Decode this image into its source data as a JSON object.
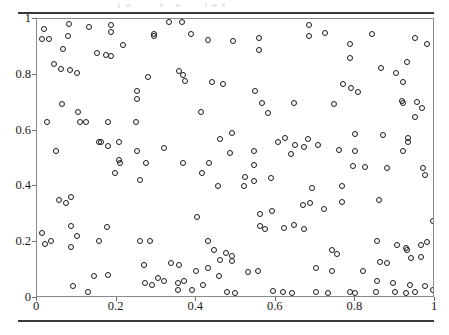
{
  "figure": {
    "background_color": "#ffffff",
    "marker_color": "#1a1a1a",
    "frame_color": "#8a8a8a",
    "rule_color": "#3a3a3a",
    "title": "",
    "top_rule_label": "",
    "bottom_rule_label": ""
  },
  "axes": {
    "x_ticklabels": [
      "0",
      "0.2",
      "0.4",
      "0.6",
      "0.8",
      "1"
    ],
    "y_ticklabels": [
      "0",
      "0.2",
      "0.4",
      "0.6",
      "0.8",
      "1"
    ],
    "x_tickvalues": [
      0,
      0.2,
      0.4,
      0.6,
      0.8,
      1
    ],
    "y_tickvalues": [
      0,
      0.2,
      0.4,
      0.6,
      0.8,
      1
    ]
  },
  "chart_data": {
    "type": "scatter",
    "title": "",
    "xlabel": "",
    "ylabel": "",
    "xlim": [
      0,
      1
    ],
    "ylim": [
      0,
      1
    ],
    "grid": false,
    "legend": null,
    "marker": "open-circle",
    "series": [
      {
        "name": "points",
        "n": 200,
        "x": [
          0.018,
          0.013,
          0.03,
          0.08,
          0.078,
          0.065,
          0.131,
          0.186,
          0.186,
          0.216,
          0.151,
          0.173,
          0.186,
          0.364,
          0.294,
          0.294,
          0.387,
          0.43,
          0.492,
          0.279,
          0.372,
          0.44,
          0.467,
          0.558,
          0.558,
          0.683,
          0.724,
          0.683,
          0.786,
          0.841,
          0.95,
          0.787,
          0.93,
          0.98,
          0.864,
          0.902,
          0.92,
          0.769,
          0.788,
          0.063,
          0.103,
          0.123,
          0.025,
          0.108,
          0.178,
          0.249,
          0.156,
          0.206,
          0.178,
          0.048,
          0.161,
          0.319,
          0.251,
          0.49,
          0.459,
          0.485,
          0.251,
          0.251,
          0.412,
          0.548,
          0.565,
          0.646,
          0.746,
          0.581,
          0.545,
          0.806,
          0.918,
          0.92,
          0.955,
          0.967,
          0.95,
          0.8,
          0.869,
          0.932,
          0.932,
          0.92,
          0.546,
          0.8,
          0.206,
          0.209,
          0.274,
          0.367,
          0.432,
          0.196,
          0.415,
          0.259,
          0.455,
          0.055,
          0.073,
          0.085,
          0.402,
          0.085,
          0.176,
          0.606,
          0.623,
          0.648,
          0.67,
          0.682,
          0.638,
          0.545,
          0.705,
          0.76,
          0.523,
          0.589,
          0.52,
          0.69,
          0.794,
          0.824,
          0.766,
          0.879,
          0.969,
          0.975,
          0.86,
          0.686,
          0.766,
          0.561,
          0.591,
          0.668,
          0.72,
          0.013,
          0.1,
          0.085,
          0.56,
          0.572,
          0.62,
          0.645,
          0.67,
          0.995,
          0.035,
          0.155,
          0.26,
          0.283,
          0.43,
          0.02,
          0.855,
          0.905,
          0.928,
          0.965,
          0.98,
          0.965,
          0.445,
          0.474,
          0.49,
          0.46,
          0.49,
          0.74,
          0.755,
          0.93,
          0.94,
          0.862,
          0.88,
          0.82,
          0.27,
          0.7,
          0.742,
          0.43,
          0.305,
          0.318,
          0.4,
          0.458,
          0.53,
          0.556,
          0.272,
          0.29,
          0.355,
          0.37,
          0.418,
          0.142,
          0.178,
          0.855,
          0.895,
          0.937,
          0.975,
          0.995,
          0.042,
          0.06,
          0.084,
          0.1,
          0.332,
          0.356,
          0.366,
          0.336,
          0.357,
          0.091,
          0.128,
          0.355,
          0.39,
          0.478,
          0.498,
          0.593,
          0.617,
          0.64,
          0.7,
          0.73,
          0.787,
          0.8,
          0.852,
          0.9,
          0.926,
          0.95
        ],
        "y": [
          0.965,
          0.928,
          0.928,
          0.981,
          0.939,
          0.892,
          0.971,
          0.978,
          0.953,
          0.908,
          0.878,
          0.872,
          0.866,
          0.99,
          0.946,
          0.939,
          0.946,
          0.925,
          0.921,
          0.793,
          0.778,
          0.774,
          0.766,
          0.931,
          0.888,
          0.98,
          0.95,
          0.939,
          0.91,
          0.946,
          0.931,
          0.862,
          0.845,
          0.91,
          0.824,
          0.806,
          0.774,
          0.766,
          0.753,
          0.696,
          0.667,
          0.632,
          0.632,
          0.632,
          0.632,
          0.632,
          0.56,
          0.56,
          0.546,
          0.528,
          0.56,
          0.537,
          0.528,
          0.59,
          0.57,
          0.52,
          0.742,
          0.714,
          0.668,
          0.743,
          0.699,
          0.699,
          0.696,
          0.664,
          0.527,
          0.739,
          0.706,
          0.699,
          0.702,
          0.681,
          0.649,
          0.589,
          0.584,
          0.573,
          0.56,
          0.528,
          0.478,
          0.527,
          0.495,
          0.484,
          0.484,
          0.484,
          0.484,
          0.448,
          0.448,
          0.423,
          0.402,
          0.352,
          0.342,
          0.362,
          0.29,
          0.258,
          0.255,
          0.56,
          0.572,
          0.55,
          0.54,
          0.57,
          0.515,
          0.418,
          0.548,
          0.53,
          0.435,
          0.43,
          0.4,
          0.395,
          0.472,
          0.47,
          0.402,
          0.465,
          0.465,
          0.44,
          0.35,
          0.34,
          0.345,
          0.3,
          0.312,
          0.332,
          0.318,
          0.232,
          0.222,
          0.182,
          0.258,
          0.248,
          0.252,
          0.262,
          0.248,
          0.275,
          0.205,
          0.205,
          0.205,
          0.205,
          0.205,
          0.195,
          0.205,
          0.19,
          0.178,
          0.19,
          0.2,
          0.148,
          0.172,
          0.16,
          0.152,
          0.138,
          0.132,
          0.172,
          0.158,
          0.172,
          0.142,
          0.13,
          0.125,
          0.098,
          0.118,
          0.108,
          0.098,
          0.108,
          0.072,
          0.06,
          0.098,
          0.078,
          0.092,
          0.098,
          0.052,
          0.048,
          0.052,
          0.06,
          0.048,
          0.08,
          0.082,
          0.06,
          0.055,
          0.045,
          0.042,
          0.03,
          0.838,
          0.82,
          0.818,
          0.806,
          0.99,
          0.812,
          0.8,
          0.125,
          0.118,
          0.042,
          0.02,
          0.03,
          0.028,
          0.022,
          0.018,
          0.025,
          0.02,
          0.018,
          0.022,
          0.018,
          0.02,
          0.018,
          0.022,
          0.02,
          0.018,
          0.022
        ]
      }
    ]
  }
}
